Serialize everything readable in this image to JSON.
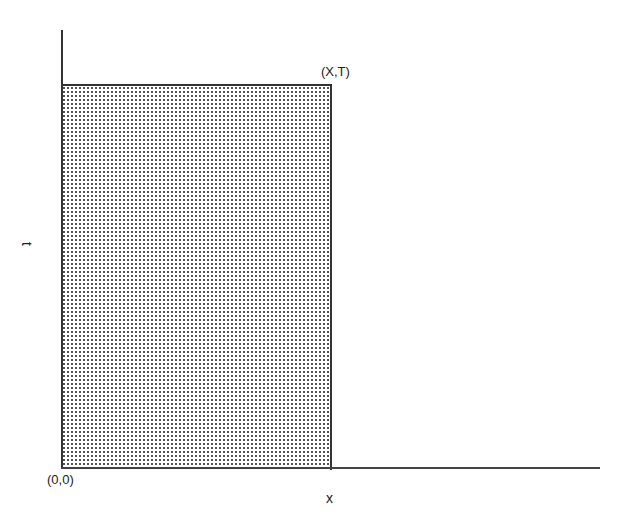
{
  "diagram": {
    "region": {
      "shading": "dotted stipple",
      "fill_color": "#555555",
      "border_color": "#333333"
    },
    "labels": {
      "corner": "(X,T)",
      "origin": "(0,0)",
      "x_axis": "x",
      "y_axis": "t"
    }
  }
}
